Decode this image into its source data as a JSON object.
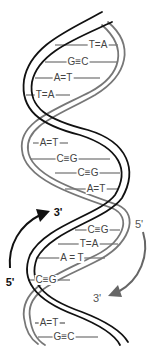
{
  "diagram": {
    "colors": {
      "strand_black": "#111111",
      "strand_gray": "#777777",
      "rung": "#555555",
      "label": "#444444",
      "background": "#ffffff"
    },
    "base_pairs": [
      {
        "label": "T=A",
        "y": 45,
        "x1": 55,
        "x2": 118,
        "lx": 98
      },
      {
        "label": "G≡C",
        "y": 62,
        "x1": 45,
        "x2": 118,
        "lx": 78
      },
      {
        "label": "A=T",
        "y": 78,
        "x1": 35,
        "x2": 100,
        "lx": 63
      },
      {
        "label": "T=A",
        "y": 95,
        "x1": 26,
        "x2": 70,
        "lx": 45
      },
      {
        "label": "A=T",
        "y": 143,
        "x1": 33,
        "x2": 68,
        "lx": 49
      },
      {
        "label": "C≡G",
        "y": 159,
        "x1": 30,
        "x2": 110,
        "lx": 67
      },
      {
        "label": "C≡G",
        "y": 173,
        "x1": 55,
        "x2": 120,
        "lx": 88
      },
      {
        "label": "A=T",
        "y": 189,
        "x1": 65,
        "x2": 118,
        "lx": 96
      },
      {
        "label": "C≡G",
        "y": 230,
        "x1": 75,
        "x2": 120,
        "lx": 98
      },
      {
        "label": "T=A",
        "y": 244,
        "x1": 58,
        "x2": 118,
        "lx": 89
      },
      {
        "label": "A = T",
        "y": 258,
        "x1": 38,
        "x2": 105,
        "lx": 72
      },
      {
        "label": "C≡G",
        "y": 280,
        "x1": 28,
        "x2": 70,
        "lx": 46
      },
      {
        "label": "A=T",
        "y": 323,
        "x1": 35,
        "x2": 65,
        "lx": 49
      },
      {
        "label": "G≡C",
        "y": 337,
        "x1": 38,
        "x2": 98,
        "lx": 64
      }
    ],
    "left_arrow": {
      "start_label": "5'",
      "end_label": "3'",
      "color": "#111111"
    },
    "right_arrow": {
      "start_label": "5'",
      "end_label": "3'",
      "color": "#666666"
    }
  }
}
